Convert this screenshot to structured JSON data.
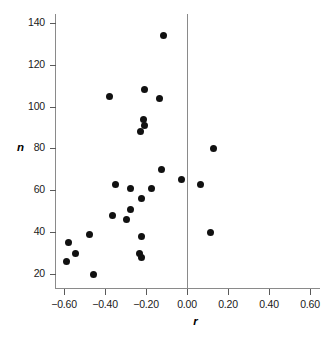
{
  "chart_data": {
    "type": "scatter",
    "title": "",
    "xlabel": "r",
    "ylabel": "n",
    "xlim": [
      -0.7,
      0.68
    ],
    "ylim": [
      13,
      145
    ],
    "grid": false,
    "legend": null,
    "xticks": [
      -0.6,
      -0.4,
      -0.2,
      0.0,
      0.2,
      0.4,
      0.6
    ],
    "xtick_labels": [
      "−0.60",
      "−0.40",
      "−0.20",
      "0.00",
      "0.20",
      "0.40",
      "0.60"
    ],
    "yticks": [
      20,
      40,
      60,
      80,
      100,
      120,
      140
    ],
    "ytick_labels": [
      "20",
      "40",
      "60",
      "80",
      "100",
      "120",
      "140"
    ],
    "reference_lines": [
      {
        "axis": "x",
        "value": 0.0,
        "name": "zero-correlation-line"
      }
    ],
    "marker": {
      "shape": "circle",
      "color": "#111111",
      "size": 7
    },
    "points": [
      {
        "r": -0.117,
        "n": 134
      },
      {
        "r": -0.205,
        "n": 108
      },
      {
        "r": -0.376,
        "n": 105
      },
      {
        "r": -0.132,
        "n": 104
      },
      {
        "r": -0.21,
        "n": 94
      },
      {
        "r": -0.205,
        "n": 91
      },
      {
        "r": -0.229,
        "n": 88
      },
      {
        "r": 0.127,
        "n": 80
      },
      {
        "r": -0.122,
        "n": 70
      },
      {
        "r": -0.029,
        "n": 65
      },
      {
        "r": 0.068,
        "n": 63
      },
      {
        "r": -0.351,
        "n": 63
      },
      {
        "r": -0.278,
        "n": 61
      },
      {
        "r": -0.171,
        "n": 61
      },
      {
        "r": -0.224,
        "n": 56
      },
      {
        "r": -0.278,
        "n": 51
      },
      {
        "r": -0.361,
        "n": 48
      },
      {
        "r": -0.293,
        "n": 46
      },
      {
        "r": 0.117,
        "n": 40
      },
      {
        "r": -0.224,
        "n": 38
      },
      {
        "r": -0.478,
        "n": 39
      },
      {
        "r": -0.58,
        "n": 35
      },
      {
        "r": -0.542,
        "n": 30
      },
      {
        "r": -0.234,
        "n": 30
      },
      {
        "r": -0.224,
        "n": 28
      },
      {
        "r": -0.59,
        "n": 26
      },
      {
        "r": -0.454,
        "n": 20
      }
    ]
  }
}
